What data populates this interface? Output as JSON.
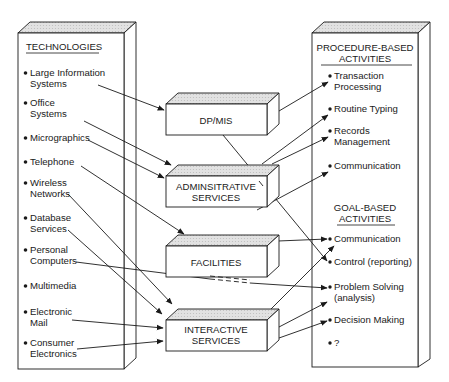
{
  "left_panel": {
    "header": "TECHNOLOGIES",
    "items": [
      {
        "line1": "Large Information",
        "line2": "Systems"
      },
      {
        "line1": "Office",
        "line2": "Systems"
      },
      {
        "line1": "Micrographics",
        "line2": ""
      },
      {
        "line1": "Telephone",
        "line2": ""
      },
      {
        "line1": "Wireless",
        "line2": "Networks"
      },
      {
        "line1": "Database",
        "line2": "Services"
      },
      {
        "line1": "Personal",
        "line2": "Computers"
      },
      {
        "line1": "Multimedia",
        "line2": ""
      },
      {
        "line1": "Electronic",
        "line2": "Mail"
      },
      {
        "line1": "Consumer",
        "line2": "Electronics"
      }
    ]
  },
  "middle_boxes": [
    {
      "line1": "DP/MIS",
      "line2": ""
    },
    {
      "line1": "ADMINSITRATIVE",
      "line2": "SERVICES"
    },
    {
      "line1": "FACILITIES",
      "line2": ""
    },
    {
      "line1": "INTERACTIVE",
      "line2": "SERVICES"
    }
  ],
  "right_panel": {
    "procedure_header": {
      "line1": "PROCEDURE-BASED",
      "line2": "ACTIVITIES"
    },
    "procedure_items": [
      {
        "line1": "Transaction",
        "line2": "Processing"
      },
      {
        "line1": "Routine Typing",
        "line2": ""
      },
      {
        "line1": "Records",
        "line2": "Management"
      },
      {
        "line1": "Communication",
        "line2": ""
      }
    ],
    "goal_header": {
      "line1": "GOAL-BASED",
      "line2": "ACTIVITIES"
    },
    "goal_items": [
      {
        "line1": "Communication",
        "line2": ""
      },
      {
        "line1": "Control (reporting)",
        "line2": ""
      },
      {
        "line1": "Problem Solving",
        "line2": "(analysis)"
      },
      {
        "line1": "Decision Making",
        "line2": ""
      },
      {
        "line1": "?",
        "line2": ""
      }
    ]
  },
  "colors": {
    "stroke": "#1a1a1a",
    "box_top": "#d6d6d6",
    "box_side": "#ffffff",
    "background": "#ffffff"
  }
}
